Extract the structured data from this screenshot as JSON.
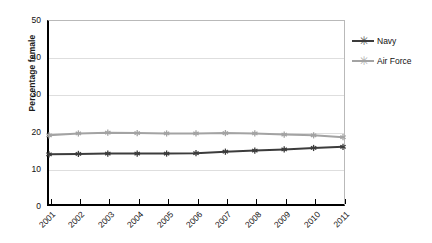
{
  "chart_data": {
    "type": "line",
    "title": "",
    "xlabel": "",
    "ylabel": "Percentage female",
    "x": [
      "2001",
      "2002",
      "2003",
      "2004",
      "2005",
      "2006",
      "2007",
      "2008",
      "2009",
      "2010",
      "2011"
    ],
    "ylim": [
      0,
      50
    ],
    "yticks": [
      "0",
      "10",
      "20",
      "30",
      "40",
      "50"
    ],
    "grid": "horizontal",
    "legend_position": "right",
    "series": [
      {
        "name": "Navy",
        "color": "#3c3c3c",
        "marker": "asterisk",
        "values": [
          13.9,
          14.0,
          14.1,
          14.1,
          14.1,
          14.2,
          14.6,
          14.9,
          15.2,
          15.6,
          15.9
        ]
      },
      {
        "name": "Air Force",
        "color": "#a3a3a3",
        "marker": "asterisk",
        "values": [
          19.0,
          19.5,
          19.7,
          19.6,
          19.5,
          19.5,
          19.6,
          19.5,
          19.2,
          19.0,
          18.5
        ]
      }
    ]
  },
  "legend": {
    "items": [
      {
        "label": "Navy",
        "color": "#3c3c3c"
      },
      {
        "label": "Air Force",
        "color": "#a3a3a3"
      }
    ]
  },
  "axes": {
    "y_title": "Percentage female"
  }
}
